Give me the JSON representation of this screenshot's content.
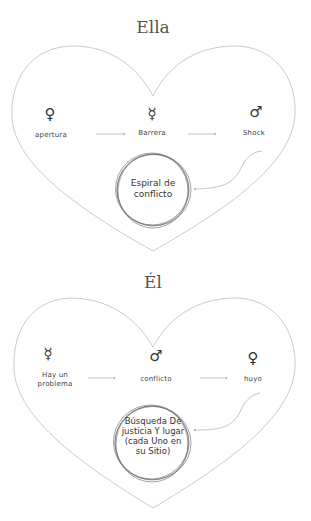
{
  "diagrams": [
    {
      "title": "Ella",
      "steps": [
        {
          "symbol": "♀",
          "symbol_name": "venus",
          "label": "apertura"
        },
        {
          "symbol": "☿",
          "symbol_name": "mercury",
          "label": "Barrera"
        },
        {
          "symbol": "♂",
          "symbol_name": "mars",
          "label": "Shock"
        }
      ],
      "result": "Espiral de conflicto"
    },
    {
      "title": "Él",
      "steps": [
        {
          "symbol": "☿",
          "symbol_name": "mercury",
          "label": "Hay un problema"
        },
        {
          "symbol": "♂",
          "symbol_name": "mars",
          "label": "conflicto"
        },
        {
          "symbol": "♀",
          "symbol_name": "venus",
          "label": "huyo"
        }
      ],
      "result": "Búsqueda De justicia Y lugar (cada Uno en su Sitio)"
    }
  ],
  "colors": {
    "outline": "#b8b8b8",
    "text": "#333333",
    "title": "#555555",
    "background": "#ffffff"
  }
}
